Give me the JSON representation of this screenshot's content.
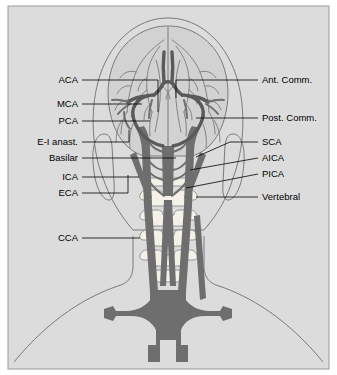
{
  "figure": {
    "view": "posterior",
    "panel": {
      "background_color": "#dcdcdc",
      "border_color": "#9a9a9a"
    },
    "colors": {
      "vessel": "#6e6e6e",
      "vessel_dark": "#5a5a5a",
      "outline": "#7a7a7a",
      "brain_fill": "#d2d2d2",
      "bone_fill": "#f4f2e8",
      "bone_outline": "#8a8a8a",
      "label_text": "#000000",
      "leader_line": "#000000"
    },
    "labels_left": [
      {
        "id": "aca",
        "text": "ACA",
        "text_x": 78,
        "text_y": 83,
        "leader": "M 82,80 L 158,80 L 158,112"
      },
      {
        "id": "mca",
        "text": "MCA",
        "text_x": 78,
        "text_y": 107,
        "leader": "M 82,104 L 142,104"
      },
      {
        "id": "pca",
        "text": "PCA",
        "text_x": 78,
        "text_y": 124,
        "leader": "M 82,121 L 150,121"
      },
      {
        "id": "ei-anast",
        "text": "E-I anast.",
        "text_x": 78,
        "text_y": 145,
        "leader": "M 82,142 L 129,142 L 129,130"
      },
      {
        "id": "basilar",
        "text": "Basilar",
        "text_x": 78,
        "text_y": 161,
        "leader": "M 82,158 L 176,158"
      },
      {
        "id": "ica",
        "text": "ICA",
        "text_x": 78,
        "text_y": 180,
        "leader": "M 82,177 L 139,177"
      },
      {
        "id": "eca",
        "text": "ECA",
        "text_x": 78,
        "text_y": 196,
        "leader": "M 82,193 L 128,193 L 128,175"
      },
      {
        "id": "cca",
        "text": "CCA",
        "text_x": 78,
        "text_y": 241,
        "leader": "M 82,238 L 140,238"
      }
    ],
    "labels_right": [
      {
        "id": "ant-comm",
        "text": "Ant. Comm.",
        "text_x": 262,
        "text_y": 83,
        "leader": "M 258,80 L 176,80 L 176,98"
      },
      {
        "id": "post-comm",
        "text": "Post. Comm.",
        "text_x": 262,
        "text_y": 121,
        "leader": "M 258,118 L 196,118"
      },
      {
        "id": "sca",
        "text": "SCA",
        "text_x": 262,
        "text_y": 145,
        "leader": "M 258,142 L 230,142 L 230,142 L 196,157"
      },
      {
        "id": "aica",
        "text": "AICA",
        "text_x": 262,
        "text_y": 161,
        "leader": "M 258,158 L 190,170"
      },
      {
        "id": "pica",
        "text": "PICA",
        "text_x": 262,
        "text_y": 177,
        "leader": "M 258,174 L 186,188"
      },
      {
        "id": "vertebral",
        "text": "Vertebral",
        "text_x": 262,
        "text_y": 200,
        "leader": "M 258,197 L 196,197"
      }
    ]
  }
}
